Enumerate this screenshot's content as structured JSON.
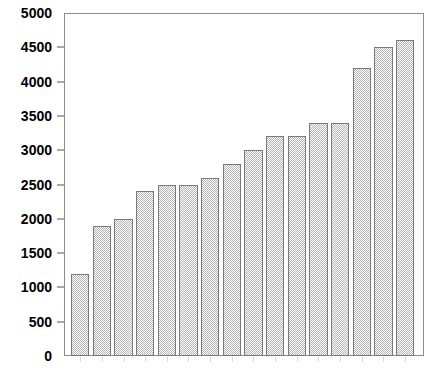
{
  "chart_data": {
    "type": "bar",
    "title": "",
    "subtitle": "",
    "xlabel": "",
    "ylabel": "",
    "categories": [
      "1",
      "2",
      "3",
      "4",
      "5",
      "6",
      "7",
      "8",
      "9",
      "10",
      "11",
      "12",
      "13",
      "14",
      "15",
      "16"
    ],
    "values": [
      1200,
      1900,
      2000,
      2400,
      2500,
      2500,
      2600,
      2800,
      3000,
      3200,
      3200,
      3400,
      3400,
      4200,
      4500,
      4600
    ],
    "ylim": [
      0,
      5000
    ],
    "y_ticks": [
      0,
      500,
      1000,
      1500,
      2000,
      2500,
      3000,
      3500,
      4000,
      4500,
      5000
    ],
    "y_tick_labels": [
      "0",
      "500",
      "1000",
      "1500",
      "2000",
      "2500",
      "3000",
      "3500",
      "4000",
      "4500",
      "5000"
    ],
    "x_tick_labels": [
      "",
      "",
      "",
      "",
      "",
      "",
      "",
      "",
      "",
      "",
      "",
      "",
      "",
      "",
      "",
      ""
    ],
    "grid": false,
    "legend": null,
    "legend_position": "none",
    "bar_fill_pattern": "checkerboard-hatch",
    "bar_fill_color": "#b4b4b4",
    "bar_border_color": "#7a7a7a",
    "axis_color": "#8c8c8c",
    "text_color": "#000000",
    "background_color": "#ffffff"
  }
}
